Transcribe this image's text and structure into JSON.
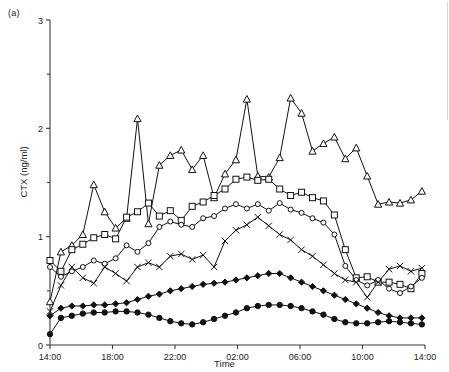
{
  "figure": {
    "panel_label": "(a)",
    "width": 449,
    "height": 372
  },
  "chart_data": {
    "type": "line",
    "title": "",
    "subtitle": "",
    "panel": "(a)",
    "xlabel": "Time",
    "ylabel": "CTX (ng/ml)",
    "xlim": [
      0,
      24
    ],
    "ylim": [
      0,
      3
    ],
    "grid": false,
    "legend": "none",
    "x_tick_labels": [
      "14:00",
      "18:00",
      "22:00",
      "02:00",
      "06:00",
      "10:00",
      "14:00"
    ],
    "x_tick_values": [
      0,
      4,
      8,
      12,
      16,
      20,
      24
    ],
    "y_tick_labels": [
      "0",
      "1",
      "2",
      "3"
    ],
    "y_tick_values": [
      0,
      1,
      2,
      3
    ],
    "y_minor_ticks": [
      0.5,
      1.5,
      2.5
    ],
    "x": [
      0,
      0.7,
      1.4,
      2.1,
      2.8,
      3.5,
      4.2,
      4.9,
      5.6,
      6.3,
      7.0,
      7.7,
      8.4,
      9.1,
      9.8,
      10.5,
      11.2,
      11.9,
      12.6,
      13.3,
      14.0,
      14.7,
      15.4,
      16.1,
      16.8,
      17.5,
      18.2,
      18.9,
      19.6,
      20.3,
      21.0,
      21.7,
      22.4,
      23.1,
      23.8
    ],
    "series": [
      {
        "name": "subject-1",
        "marker": "triangle-open",
        "values": [
          0.4,
          0.86,
          0.92,
          1.02,
          1.48,
          1.23,
          1.08,
          1.17,
          2.09,
          1.12,
          1.66,
          1.75,
          1.8,
          1.62,
          1.75,
          1.36,
          1.58,
          1.71,
          2.27,
          1.56,
          1.55,
          1.73,
          2.28,
          2.14,
          1.79,
          1.86,
          1.92,
          1.72,
          1.82,
          1.56,
          1.3,
          1.32,
          1.31,
          1.34,
          1.42
        ]
      },
      {
        "name": "subject-2",
        "marker": "square-open",
        "values": [
          0.78,
          0.68,
          0.88,
          0.93,
          0.99,
          1.02,
          0.98,
          1.18,
          1.23,
          1.31,
          1.19,
          1.24,
          1.15,
          1.28,
          1.32,
          1.38,
          1.44,
          1.53,
          1.55,
          1.52,
          1.53,
          1.44,
          1.38,
          1.41,
          1.36,
          1.33,
          1.2,
          0.88,
          0.62,
          0.63,
          0.58,
          0.58,
          0.56,
          0.52,
          0.66
        ]
      },
      {
        "name": "subject-3",
        "marker": "circle-open",
        "values": [
          0.72,
          0.63,
          0.68,
          0.72,
          0.78,
          0.75,
          0.8,
          0.92,
          0.86,
          0.94,
          1.09,
          1.14,
          1.11,
          1.09,
          1.17,
          1.19,
          1.26,
          1.3,
          1.26,
          1.3,
          1.24,
          1.31,
          1.25,
          1.22,
          1.17,
          1.13,
          1.02,
          0.73,
          0.6,
          0.55,
          0.6,
          0.52,
          0.48,
          0.54,
          0.62
        ]
      },
      {
        "name": "subject-4",
        "marker": "cross",
        "values": [
          0.31,
          0.55,
          0.72,
          0.62,
          0.57,
          0.72,
          0.66,
          0.59,
          0.72,
          0.76,
          0.72,
          0.82,
          0.84,
          0.79,
          0.83,
          0.72,
          0.96,
          1.06,
          1.11,
          1.18,
          1.1,
          1.02,
          0.97,
          0.88,
          0.82,
          0.74,
          0.66,
          0.6,
          0.58,
          0.44,
          0.58,
          0.7,
          0.73,
          0.68,
          0.71
        ]
      },
      {
        "name": "subject-5",
        "marker": "diamond-filled",
        "values": [
          0.27,
          0.34,
          0.36,
          0.36,
          0.37,
          0.37,
          0.38,
          0.39,
          0.42,
          0.45,
          0.47,
          0.5,
          0.52,
          0.54,
          0.56,
          0.57,
          0.58,
          0.6,
          0.62,
          0.64,
          0.66,
          0.66,
          0.62,
          0.58,
          0.54,
          0.5,
          0.46,
          0.42,
          0.38,
          0.34,
          0.3,
          0.27,
          0.25,
          0.25,
          0.25
        ]
      },
      {
        "name": "subject-6",
        "marker": "circle-filled",
        "values": [
          0.1,
          0.25,
          0.27,
          0.29,
          0.3,
          0.3,
          0.31,
          0.31,
          0.3,
          0.28,
          0.25,
          0.22,
          0.2,
          0.19,
          0.21,
          0.24,
          0.27,
          0.3,
          0.34,
          0.36,
          0.37,
          0.37,
          0.36,
          0.34,
          0.31,
          0.28,
          0.24,
          0.21,
          0.2,
          0.2,
          0.21,
          0.22,
          0.21,
          0.2,
          0.19
        ]
      }
    ]
  }
}
